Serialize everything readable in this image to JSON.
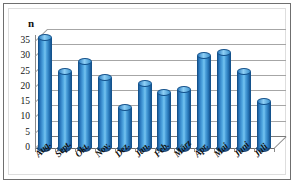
{
  "chart_data": {
    "type": "bar",
    "title": "",
    "subtitle": "",
    "xlabel": "",
    "ylabel": "n",
    "categories": [
      "Aug.",
      "Sept.",
      "Okt.",
      "Nov.",
      "Dez.",
      "Jan.",
      "Feb.",
      "März",
      "Apr.",
      "Mai",
      "Juni",
      "Juli"
    ],
    "values": [
      36,
      25,
      28,
      23,
      13,
      21,
      18,
      19,
      30,
      31,
      25,
      15
    ],
    "series": [
      {
        "name": "n",
        "values": [
          36,
          25,
          28,
          23,
          13,
          21,
          18,
          19,
          30,
          31,
          25,
          15
        ]
      }
    ],
    "ylim": [
      0,
      35
    ],
    "ytick_labels": [
      "35",
      "30",
      "25",
      "20",
      "15",
      "10",
      "5",
      "0"
    ],
    "ytick_values": [
      35,
      30,
      25,
      20,
      15,
      10,
      5,
      0
    ],
    "ytick_step": 5,
    "grid": true,
    "grid_axis": "y",
    "legend": false,
    "legend_position": "none",
    "style": "3d-cylinder",
    "annotations": []
  },
  "axis": {
    "value_axis_title": "n"
  },
  "colors": {
    "bar_light": "#76c4f0",
    "bar_mid": "#2f7fc4",
    "bar_dark": "#14528c",
    "gridline": "#a6a6a6",
    "axis": "#6c6c6c",
    "frame_border": "#6f6f6f",
    "background": "#ffffff",
    "text": "#111111"
  }
}
